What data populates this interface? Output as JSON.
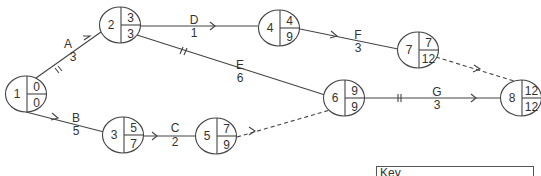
{
  "diagram": {
    "type": "activity-on-arrow network",
    "line_color": "#444444",
    "nodes": [
      {
        "id": "1",
        "earliest": "0",
        "latest": "0",
        "cx": 26,
        "cy": 94
      },
      {
        "id": "2",
        "earliest": "3",
        "latest": "3",
        "cx": 120,
        "cy": 25
      },
      {
        "id": "3",
        "earliest": "5",
        "latest": "7",
        "cx": 123,
        "cy": 135
      },
      {
        "id": "4",
        "earliest": "4",
        "latest": "9",
        "cx": 279,
        "cy": 28
      },
      {
        "id": "5",
        "earliest": "7",
        "latest": "9",
        "cx": 216,
        "cy": 136
      },
      {
        "id": "6",
        "earliest": "9",
        "latest": "9",
        "cx": 344,
        "cy": 98
      },
      {
        "id": "7",
        "earliest": "7",
        "latest": "12",
        "cx": 418,
        "cy": 50
      },
      {
        "id": "8",
        "earliest": "12",
        "latest": "12",
        "cx": 521,
        "cy": 98
      }
    ],
    "activities": [
      {
        "name": "A",
        "duration": "3",
        "from": "1",
        "to": "2",
        "critical": true,
        "dummy": false
      },
      {
        "name": "B",
        "duration": "5",
        "from": "1",
        "to": "3",
        "critical": false,
        "dummy": false
      },
      {
        "name": "C",
        "duration": "2",
        "from": "3",
        "to": "5",
        "critical": false,
        "dummy": false
      },
      {
        "name": "D",
        "duration": "1",
        "from": "2",
        "to": "4",
        "critical": false,
        "dummy": false
      },
      {
        "name": "E",
        "duration": "6",
        "from": "2",
        "to": "6",
        "critical": true,
        "dummy": false
      },
      {
        "name": "F",
        "duration": "3",
        "from": "4",
        "to": "7",
        "critical": false,
        "dummy": false
      },
      {
        "name": "G",
        "duration": "3",
        "from": "6",
        "to": "8",
        "critical": true,
        "dummy": false
      },
      {
        "name": "",
        "duration": "",
        "from": "5",
        "to": "6",
        "critical": false,
        "dummy": true
      },
      {
        "name": "",
        "duration": "",
        "from": "7",
        "to": "8",
        "critical": false,
        "dummy": true
      }
    ]
  },
  "key": {
    "title": "Key"
  }
}
